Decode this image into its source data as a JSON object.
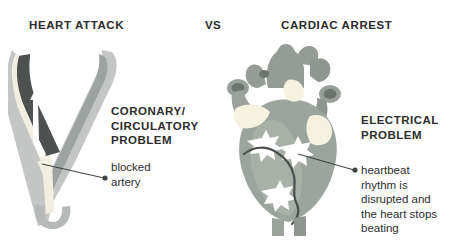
{
  "page": {
    "background_color": "#ffffff",
    "width": 457,
    "height": 242
  },
  "headings": {
    "left": "HEART ATTACK",
    "divider": "VS",
    "right": "CARDIAC ARREST"
  },
  "left_panel": {
    "illustration_name": "blocked-artery-illustration",
    "cause_label": "CORONARY/\nCIRCULATORY\nPROBLEM",
    "callout_label": "blocked\nartery"
  },
  "right_panel": {
    "illustration_name": "heart-illustration",
    "cause_label": "ELECTRICAL\nPROBLEM",
    "callout_label": "heartbeat\nrhythm is\ndisrupted and\nthe heart stops\nbeating"
  },
  "colors": {
    "text": "#2d2d2d",
    "artery_wall": "#b9bcbb",
    "artery_wall_dark": "#9ea3a2",
    "artery_lumen": "#f3efe2",
    "artery_inner": "#8e9593",
    "plaque_dark": "#4a4f4e",
    "heart_body": "#9aa39c",
    "heart_body_light": "#aab2ab",
    "heart_vessel": "#8f978f",
    "heart_vessel_dark": "#6f7670",
    "highlight_cream": "#f6f3e3",
    "spark_white": "#ffffff",
    "leader_line": "#3f4544"
  }
}
